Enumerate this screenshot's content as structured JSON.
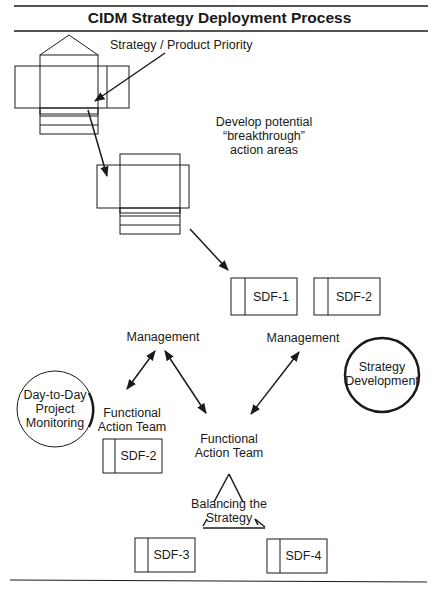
{
  "title": "CIDM Strategy Deployment Process",
  "labels": {
    "strategy_priority": "Strategy / Product Priority",
    "develop_line1": "Develop potential",
    "develop_line2": "“breakthrough”",
    "develop_line3": "action areas",
    "management_left": "Management",
    "management_right": "Management",
    "strategy_dev_line1": "Strategy",
    "strategy_dev_line2": "Development",
    "day_line1": "Day-to-Day",
    "day_line2": "Project",
    "day_line3": "Monitoring",
    "fat_left_line1": "Functional",
    "fat_left_line2": "Action Team",
    "fat_center_line1": "Functional",
    "fat_center_line2": "Action Team",
    "balancing_line1": "Balancing the",
    "balancing_line2": "Strategy"
  },
  "sdf_boxes": {
    "sdf1": "SDF-1",
    "sdf2_top": "SDF-2",
    "sdf2_left": "SDF-2",
    "sdf3": "SDF-3",
    "sdf4": "SDF-4"
  },
  "colors": {
    "stroke": "#1a1a1a",
    "background": "#ffffff"
  }
}
